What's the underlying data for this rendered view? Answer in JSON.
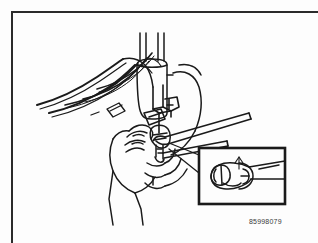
{
  "figure": {
    "reference_number": "85998079",
    "style": "black-and-white technical line drawing",
    "line_color": "#1a1a1a",
    "background_color": "#fdfdfd",
    "frame_color": "#2b2b2b"
  },
  "main_illustration": {
    "name": "main-illustration",
    "description": "Technician's hand holding a component while a long-handled wrench engages a fitting; several flexible lines sweep away to the upper left and a vertical canister sits at top center.",
    "elements": [
      {
        "name": "flexible-lines-bundle",
        "label": "Fuel and vacuum lines",
        "count": 5
      },
      {
        "name": "vertical-canister",
        "label": "Canister / reservoir"
      },
      {
        "name": "bracket-assembly",
        "label": "Mounting bracket"
      },
      {
        "name": "fitting-connector",
        "label": "Line fitting"
      },
      {
        "name": "wrench-tool",
        "label": "Flare nut wrench"
      },
      {
        "name": "technician-hand",
        "label": "Technician's hand"
      },
      {
        "name": "leader-lines",
        "label": "Callout leader to detail view"
      }
    ]
  },
  "detail_inset": {
    "name": "detail-inset",
    "label": "Enlarged detail view",
    "description": "Close-up of the fitting with the wrench seated on the nut.",
    "border_color": "#1a1a1a",
    "elements": [
      {
        "name": "inset-fitting",
        "label": "Fitting nut"
      },
      {
        "name": "inset-wrench",
        "label": "Wrench jaw"
      },
      {
        "name": "inset-line",
        "label": "Fuel line"
      }
    ]
  }
}
